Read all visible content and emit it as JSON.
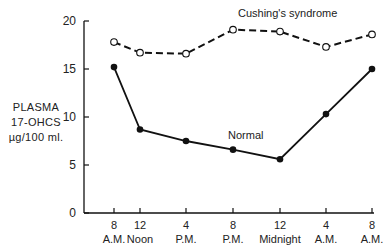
{
  "chart_data": {
    "type": "line",
    "title": "",
    "ylabel": [
      "PLASMA",
      "17-OHCS",
      "µg/100 ml."
    ],
    "xlabel": "",
    "ylim": [
      0,
      20
    ],
    "yticks": [
      0,
      5,
      10,
      15,
      20
    ],
    "grid": false,
    "legend": "inline labels",
    "categories": [
      {
        "top": "8",
        "bottom": "A.M."
      },
      {
        "top": "12",
        "bottom": "Noon"
      },
      {
        "top": "4",
        "bottom": "P.M."
      },
      {
        "top": "8",
        "bottom": "P.M."
      },
      {
        "top": "12",
        "bottom": "Midnight"
      },
      {
        "top": "4",
        "bottom": "A.M."
      },
      {
        "top": "8",
        "bottom": "A.M."
      }
    ],
    "x_hours": [
      0,
      4,
      8,
      12,
      16,
      20,
      24
    ],
    "series": [
      {
        "name": "Cushing's syndrome",
        "style": "dashed",
        "marker": "open-circle",
        "values": [
          17.8,
          16.7,
          16.6,
          19.1,
          18.9,
          17.3,
          18.6
        ]
      },
      {
        "name": "Normal",
        "style": "solid",
        "marker": "filled-circle",
        "values": [
          15.2,
          8.7,
          7.5,
          6.6,
          5.6,
          10.3,
          15.0
        ]
      }
    ]
  },
  "layout": {
    "x_px": [
      114,
      140,
      186,
      233,
      280,
      326,
      372
    ],
    "y_axis_x": 84,
    "y_top_px": 21,
    "y_bottom_px": 213,
    "x_axis_end": 374,
    "series_label_pos": [
      {
        "x": 238,
        "y": 17
      },
      {
        "x": 228,
        "y": 139
      }
    ],
    "ink_color": "#111111"
  }
}
